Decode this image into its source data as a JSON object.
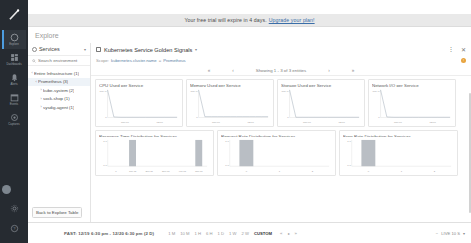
{
  "banner": {
    "text": "Your free trial will expire in 4 days.",
    "link": "Upgrade your plan!"
  },
  "rail": {
    "items": [
      {
        "name": "explore",
        "label": "Explore"
      },
      {
        "name": "dashboards",
        "label": "Dashboards"
      },
      {
        "name": "alerts",
        "label": "Alerts"
      },
      {
        "name": "events",
        "label": "Events"
      },
      {
        "name": "captures",
        "label": "Captures"
      },
      {
        "name": "settings",
        "label": "Settings"
      }
    ]
  },
  "header": {
    "title": "Explore"
  },
  "left_panel": {
    "selector_label": "Services",
    "search_placeholder": "Search environment",
    "tree": [
      {
        "label": "Entire Infrastructure (1)",
        "depth": 0,
        "twisty": "‹",
        "selected": false
      },
      {
        "label": "Prometheus (3)",
        "depth": 1,
        "twisty": "‹",
        "selected": true
      },
      {
        "label": "kube-system (2)",
        "depth": 2,
        "twisty": "›",
        "selected": false
      },
      {
        "label": "sock-shop (1)",
        "depth": 2,
        "twisty": "›",
        "selected": false
      },
      {
        "label": "sysdig-agent (1)",
        "depth": 2,
        "twisty": "›",
        "selected": false
      }
    ],
    "back_button": "Back to Explore Table"
  },
  "dashboard": {
    "title": "Kubernetes Service Golden Signals",
    "scope_label": "Scope:",
    "scope_key": "kubernetes.cluster.name",
    "scope_op": "=",
    "scope_value": "Prometheus",
    "pager": {
      "first": "«",
      "prev": "‹",
      "text": "Showing 1 - 3 of 3 entities",
      "next": "›",
      "last": "»"
    }
  },
  "charts": [
    {
      "title": "CPU Used per Service",
      "type": "line",
      "ylabel_top": "100 %",
      "ylabel_bottom": "0",
      "xticks": [
        "Thu 00",
        "12:00"
      ],
      "series": [
        {
          "name": "cpu",
          "values": [
            100,
            2,
            1,
            1,
            1,
            1,
            1,
            1,
            1,
            1,
            1,
            1
          ]
        }
      ],
      "ylim": [
        0,
        100
      ]
    },
    {
      "title": "Memory Used per Service",
      "type": "line",
      "ylabel_top": "100 %",
      "ylabel_bottom": "0",
      "xticks": [
        "Thu 00",
        "12:00"
      ],
      "series": [
        {
          "name": "mem",
          "values": [
            100,
            3,
            3,
            3,
            3,
            3,
            3,
            3,
            3,
            3,
            3,
            3
          ]
        }
      ],
      "ylim": [
        0,
        100
      ]
    },
    {
      "title": "Storage Used per Service",
      "type": "line",
      "ylabel_top": "100 %",
      "ylabel_bottom": "0",
      "xticks": [
        "Thu 00",
        "12:00"
      ],
      "series": [
        {
          "name": "storage",
          "values": [
            100,
            1,
            1,
            1,
            1,
            1,
            1,
            1,
            1,
            1,
            1,
            1
          ]
        }
      ],
      "ylim": [
        0,
        100
      ]
    },
    {
      "title": "Network I/O per Service",
      "type": "line",
      "ylabel_top": "100 %",
      "ylabel_bottom": "0",
      "xticks": [
        "Thu 00",
        "12:00"
      ],
      "series": [
        {
          "name": "net",
          "values": [
            100,
            2,
            1,
            1,
            1,
            1,
            1,
            1,
            1,
            1,
            1,
            1
          ]
        }
      ],
      "ylim": [
        0,
        100
      ]
    },
    {
      "title": "Response Time Distribution for Services",
      "type": "bar",
      "ylabel_top": "1.0",
      "ylabel_bottom": "0.0",
      "categories": [
        "0",
        "100 µs",
        "200 µs",
        "300 µs",
        "400 µs",
        "500 µs"
      ],
      "values": [
        0,
        1.0,
        0,
        0,
        0,
        1.0
      ],
      "ylim": [
        0,
        1
      ]
    },
    {
      "title": "Request Rate Distribution for Services",
      "type": "bar",
      "ylabel_top": "1.0",
      "ylabel_bottom": "0.0",
      "categories": [
        "0",
        "1",
        "2"
      ],
      "values": [
        1.0,
        0,
        0
      ],
      "ylim": [
        0,
        1
      ]
    },
    {
      "title": "Error Rate Distribution for Services",
      "type": "bar",
      "ylabel_top": "1.0",
      "ylabel_bottom": "0.0",
      "categories": [
        "0",
        "1",
        "2"
      ],
      "values": [
        1.0,
        0,
        0
      ],
      "ylim": [
        0,
        1
      ]
    }
  ],
  "timebar": {
    "range": "PAST: 12/19 6:30 pm - 12/20 6:30 pm (2 D)",
    "presets": [
      "1 M",
      "10 M",
      "1 H",
      "6 H",
      "1 D",
      "1 W",
      "2 W",
      "CUSTOM"
    ],
    "active_preset": "CUSTOM",
    "nav": [
      "«",
      "▸",
      "»"
    ],
    "zoom": "−",
    "live": "LIVE 10 S",
    "live_caret": "▾"
  }
}
